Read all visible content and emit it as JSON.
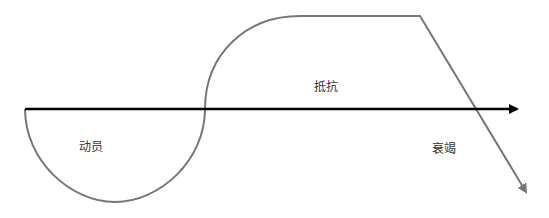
{
  "diagram": {
    "type": "stress-response curve",
    "axis": {
      "color": "#000000",
      "stroke_width": 2.5
    },
    "curve": {
      "color": "#777777",
      "stroke_width": 2
    },
    "stages": [
      {
        "label": "动员",
        "position": "below-axis-left"
      },
      {
        "label": "抵抗",
        "position": "above-axis-middle"
      },
      {
        "label": "衰竭",
        "position": "below-axis-right"
      }
    ]
  }
}
